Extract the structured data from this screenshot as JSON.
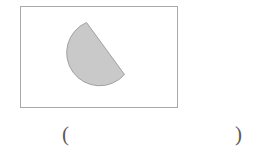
{
  "page": {
    "background_color": "#ffffff",
    "width": 253,
    "height": 157
  },
  "figure": {
    "frame": {
      "border_color": "#a9a9a9",
      "fill_color": "#ffffff",
      "x": 20,
      "y": 6,
      "width": 158,
      "height": 102
    },
    "shape": {
      "name": "semicircle",
      "description": "rotated half-disc",
      "fill_color": "#c9c9c9",
      "stroke_color": "#a0a0a0",
      "radius": 33,
      "rotation_degrees": 126,
      "center_x": 104,
      "center_y": 47
    }
  },
  "answer": {
    "open_paren": "(",
    "close_paren": ")",
    "value": ""
  }
}
